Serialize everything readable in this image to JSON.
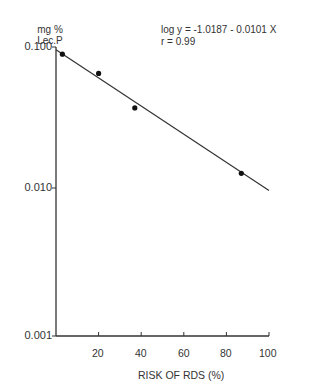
{
  "chart_data": {
    "type": "scatter",
    "title": "",
    "xlabel": "RISK OF RDS (%)",
    "ylabel": "mg % Lec.P",
    "ylabel_lines": [
      "mg %",
      "Lec.P"
    ],
    "yscale": "log",
    "xlim": [
      0,
      100
    ],
    "ylim": [
      0.001,
      0.1
    ],
    "grid": false,
    "legend": null,
    "x_ticks": [
      20,
      40,
      60,
      80,
      100
    ],
    "x_tick_labels": [
      "20",
      "40",
      "60",
      "80",
      "100"
    ],
    "y_ticks": [
      0.1,
      0.01,
      0.001
    ],
    "y_tick_labels": [
      "0.100",
      "0.010",
      "0.001"
    ],
    "series": [
      {
        "name": "observations",
        "type": "scatter",
        "x": [
          3,
          20,
          37,
          87
        ],
        "y": [
          0.089,
          0.065,
          0.037,
          0.0127
        ]
      },
      {
        "name": "regression line",
        "type": "line",
        "x": [
          0,
          100
        ],
        "y": [
          0.0958,
          0.0096
        ]
      }
    ],
    "annotations": [
      "log y = -1.0187 - 0.0101 X",
      "r = 0.99"
    ],
    "regression": {
      "intercept": -1.0187,
      "slope": -0.0101,
      "r": 0.99
    }
  }
}
